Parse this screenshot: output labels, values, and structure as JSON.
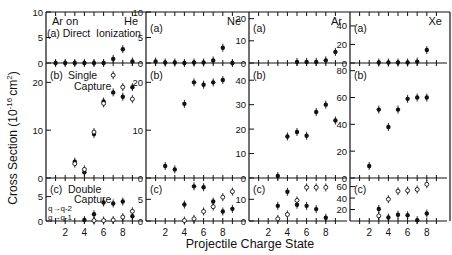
{
  "figure": {
    "ylabel": "Cross Section (10⁻¹⁶ cm²)",
    "ylabel_main": "Cross Section (10",
    "ylabel_exp": "-16",
    "ylabel_unit": "cm",
    "ylabel_unit_exp": "2",
    "ylabel_close": ")",
    "xlabel": "Projectile Charge State",
    "header_line1_left": "Ar on",
    "header_line2": "(a) Direct  Ionization",
    "legend_c_line1": "q→q-2",
    "legend_c_line2": "q→q-1"
  },
  "chart_data": [
    {
      "type": "scatter",
      "title": "Ar on He",
      "target": "He",
      "xlabel": "Projectile Charge State",
      "ylabel": "Cross Section (10^-16 cm^2)",
      "panels": [
        {
          "id": "a",
          "label": "(a) Direct Ionization",
          "ylim": [
            0,
            10
          ],
          "yticks": [
            0,
            5,
            10
          ],
          "series": [
            {
              "name": "direct",
              "marker": "filled",
              "x": [
                1,
                2,
                3,
                4,
                5,
                6,
                7,
                8,
                9
              ],
              "y": [
                0,
                0,
                0,
                0,
                0,
                0,
                0.8,
                2.7,
                0.3
              ]
            }
          ]
        },
        {
          "id": "b",
          "label": "(b) Single Capture",
          "ylim": [
            0,
            23
          ],
          "yticks": [
            0,
            10,
            20
          ],
          "series": [
            {
              "name": "filled",
              "marker": "filled",
              "x": [
                3,
                4,
                5,
                6,
                7,
                8,
                9
              ],
              "y": [
                3.4,
                1.2,
                9.2,
                16.0,
                17.9,
                17.0,
                19.0
              ]
            },
            {
              "name": "open",
              "marker": "open",
              "x": [
                3,
                4,
                5,
                6,
                7,
                8,
                9
              ],
              "y": [
                3.0,
                1.8,
                9.6,
                15.6,
                21.5,
                19.0,
                16.5
              ]
            }
          ]
        },
        {
          "id": "c",
          "label": "(c) Double Capture",
          "ylim": [
            0,
            8
          ],
          "yticks": [
            0,
            5
          ],
          "series": [
            {
              "name": "q→q-2",
              "marker": "filled",
              "x": [
                4,
                5,
                6,
                7,
                8,
                9
              ],
              "y": [
                0.2,
                1.4,
                3.8,
                3.6,
                4.0,
                1.0
              ]
            },
            {
              "name": "q→q-1",
              "marker": "open",
              "x": [
                5,
                6,
                7,
                8,
                9
              ],
              "y": [
                0.1,
                0.1,
                0.2,
                0.8,
                2.0
              ]
            }
          ]
        }
      ]
    },
    {
      "type": "scatter",
      "title": "Ar on Ne",
      "target": "Ne",
      "panels": [
        {
          "id": "a",
          "label": "(a)",
          "ylim": [
            0,
            10
          ],
          "yticks": [
            0,
            5,
            10
          ],
          "series": [
            {
              "name": "direct",
              "marker": "filled",
              "x": [
                1,
                2,
                3,
                4,
                5,
                6,
                7,
                8,
                9
              ],
              "y": [
                0.3,
                0.1,
                0.1,
                0,
                0.1,
                0.1,
                0.5,
                3.0,
                0
              ]
            }
          ]
        },
        {
          "id": "b",
          "label": "(b)",
          "ylim": [
            0,
            23
          ],
          "yticks": [
            0,
            10,
            20
          ],
          "series": [
            {
              "name": "single",
              "marker": "filled",
              "x": [
                2,
                3,
                4,
                5,
                6,
                7,
                8
              ],
              "y": [
                2.5,
                1.8,
                15.5,
                20.0,
                19.5,
                20.0,
                20.5
              ]
            }
          ]
        },
        {
          "id": "c",
          "label": "(c)",
          "ylim": [
            0,
            9
          ],
          "yticks": [
            0,
            5
          ],
          "series": [
            {
              "name": "q→q-2",
              "marker": "filled",
              "x": [
                4,
                5,
                6,
                7,
                8,
                9
              ],
              "y": [
                3.8,
                8.0,
                7.8,
                4.5,
                2.2,
                2.8
              ]
            },
            {
              "name": "q→q-1",
              "marker": "open",
              "x": [
                4,
                5,
                6,
                7,
                8,
                9
              ],
              "y": [
                0.1,
                0.5,
                2.2,
                3.3,
                5.5,
                6.8
              ]
            }
          ]
        }
      ]
    },
    {
      "type": "scatter",
      "title": "Ar on Ar",
      "target": "Ar",
      "panels": [
        {
          "id": "a",
          "label": "(a)",
          "ylim": [
            0,
            23
          ],
          "yticks": [
            0,
            10,
            20
          ],
          "series": [
            {
              "name": "direct",
              "marker": "filled",
              "x": [
                5,
                6,
                7,
                8,
                9
              ],
              "y": [
                0.5,
                0.5,
                0.5,
                1.2,
                5.0
              ]
            }
          ]
        },
        {
          "id": "b",
          "label": "(b)",
          "ylim": [
            0,
            45
          ],
          "yticks": [
            0,
            10,
            20,
            30,
            40
          ],
          "series": [
            {
              "name": "single",
              "marker": "filled",
              "x": [
                3,
                4,
                5,
                6,
                7,
                8,
                9
              ],
              "y": [
                0.8,
                17.0,
                18.8,
                17.3,
                27.0,
                30.0,
                23.5
              ]
            }
          ]
        },
        {
          "id": "c",
          "label": "(c)",
          "ylim": [
            0,
            18
          ],
          "yticks": [
            0,
            10
          ],
          "series": [
            {
              "name": "q→q-2",
              "marker": "filled",
              "x": [
                3,
                4,
                5,
                6,
                7,
                8
              ],
              "y": [
                7.0,
                13.5,
                7.5,
                7.0,
                5.5,
                1.5
              ]
            },
            {
              "name": "q→q-1",
              "marker": "open",
              "x": [
                3,
                4,
                5,
                6,
                7,
                8
              ],
              "y": [
                1.0,
                3.0,
                9.5,
                15.5,
                15.5,
                15.5
              ]
            }
          ]
        }
      ]
    },
    {
      "type": "scatter",
      "title": "Ar on Xe",
      "target": "Xe",
      "panels": [
        {
          "id": "a",
          "label": "(a)",
          "ylim": [
            0,
            55
          ],
          "yticks": [
            0,
            20,
            40
          ],
          "series": [
            {
              "name": "direct",
              "marker": "filled",
              "x": [
                3,
                4,
                5,
                6,
                7,
                8
              ],
              "y": [
                0.5,
                0.5,
                0.5,
                0.5,
                1.5,
                14.0
              ]
            }
          ]
        },
        {
          "id": "b",
          "label": "(b)",
          "ylim": [
            0,
            82
          ],
          "yticks": [
            0,
            20,
            40,
            60,
            80
          ],
          "series": [
            {
              "name": "single",
              "marker": "filled",
              "x": [
                2,
                3,
                4,
                5,
                6,
                7,
                8
              ],
              "y": [
                9.0,
                51.0,
                38.0,
                51.0,
                59.0,
                60.0,
                60.0
              ]
            }
          ]
        },
        {
          "id": "c",
          "label": "(c)",
          "ylim": [
            0,
            68
          ],
          "yticks": [
            20,
            40,
            60
          ],
          "series": [
            {
              "name": "q→q-2",
              "marker": "filled",
              "x": [
                3,
                4,
                5,
                6,
                7,
                8
              ],
              "y": [
                21.0,
                6.0,
                11.0,
                10.0,
                1.5,
                13.0
              ]
            },
            {
              "name": "q→q-1",
              "marker": "open",
              "x": [
                3,
                4,
                5,
                6,
                7,
                8
              ],
              "y": [
                9.0,
                38.0,
                52.0,
                53.0,
                55.0,
                64.0
              ]
            }
          ]
        }
      ]
    }
  ]
}
